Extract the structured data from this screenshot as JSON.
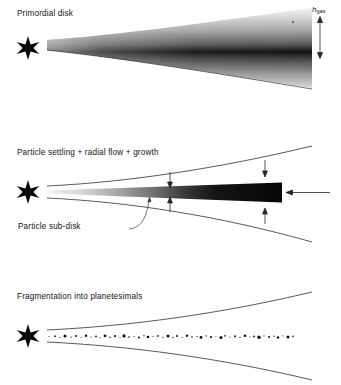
{
  "figure": {
    "background_color": "#ffffff",
    "ink_color": "#141414",
    "width": 341,
    "height": 385
  },
  "panels": [
    {
      "id": "primordial",
      "title": "Primordial disk",
      "star_glyph": "six-pointed-star",
      "annotations": [
        {
          "id": "h-gas",
          "symbol": "h",
          "subscript": "gas",
          "full_text": "h_gas",
          "type": "double-headed-vertical-arrow",
          "meaning": "gas disk scale height"
        }
      ]
    },
    {
      "id": "settling",
      "title": "Particle settling + radial flow + growth",
      "star_glyph": "six-pointed-star",
      "sublabel": "Particle sub-disk",
      "annotations": [
        {
          "id": "settle-arrow-upper-mid",
          "type": "arrow-down",
          "meaning": "particle settling toward midplane"
        },
        {
          "id": "settle-arrow-lower-mid",
          "type": "arrow-up",
          "meaning": "particle settling toward midplane"
        },
        {
          "id": "settle-arrow-upper-outer",
          "type": "arrow-down",
          "meaning": "particle settling toward midplane"
        },
        {
          "id": "settle-arrow-lower-outer",
          "type": "arrow-up",
          "meaning": "particle settling toward midplane"
        },
        {
          "id": "radial-flow-arrow",
          "type": "arrow-left",
          "meaning": "inward radial flow of particles"
        }
      ]
    },
    {
      "id": "fragment",
      "title": "Fragmentation into planetesimals",
      "star_glyph": "six-pointed-star",
      "annotations": [
        {
          "id": "planetesimal-layer",
          "type": "particle-scatter",
          "meaning": "discrete planetesimals in thin midplane layer"
        }
      ]
    }
  ]
}
